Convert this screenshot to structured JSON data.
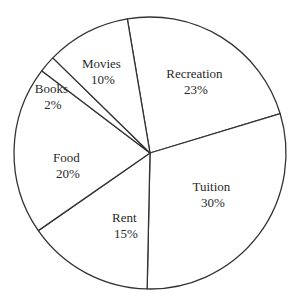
{
  "chart_data": {
    "type": "pie",
    "title": "",
    "categories": [
      "Recreation",
      "Tuition",
      "Rent",
      "Food",
      "Books",
      "Movies"
    ],
    "values": [
      23,
      30,
      15,
      20,
      2,
      10
    ],
    "unit": "%",
    "start_angle_deg": -9.6,
    "direction": "clockwise",
    "legend": "none",
    "labels_inside": true
  },
  "slices": [
    {
      "name": "Recreation",
      "pct": "23%"
    },
    {
      "name": "Tuition",
      "pct": "30%"
    },
    {
      "name": "Rent",
      "pct": "15%"
    },
    {
      "name": "Food",
      "pct": "20%"
    },
    {
      "name": "Books",
      "pct": "2%"
    },
    {
      "name": "Movies",
      "pct": "10%"
    }
  ],
  "colors": {
    "stroke": "#333333",
    "fill": "#ffffff",
    "text": "#2a2a2a"
  }
}
